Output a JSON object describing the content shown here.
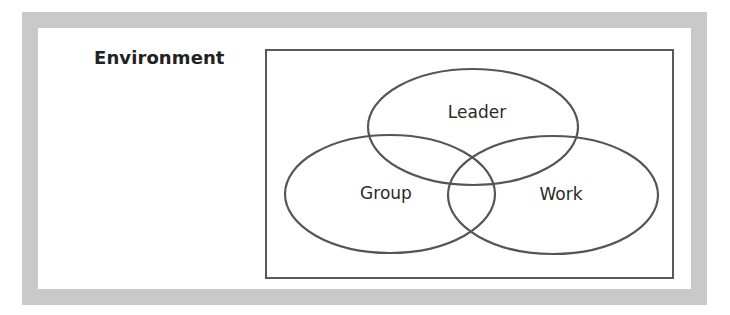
{
  "diagram": {
    "environment_label": "Environment",
    "circles": [
      {
        "id": "leader",
        "label": "Leader"
      },
      {
        "id": "group",
        "label": "Group"
      },
      {
        "id": "work",
        "label": "Work"
      }
    ]
  },
  "colors": {
    "frame_border": "#c9c9c9",
    "stroke": "#555555",
    "text": "#222222",
    "background": "#ffffff"
  }
}
